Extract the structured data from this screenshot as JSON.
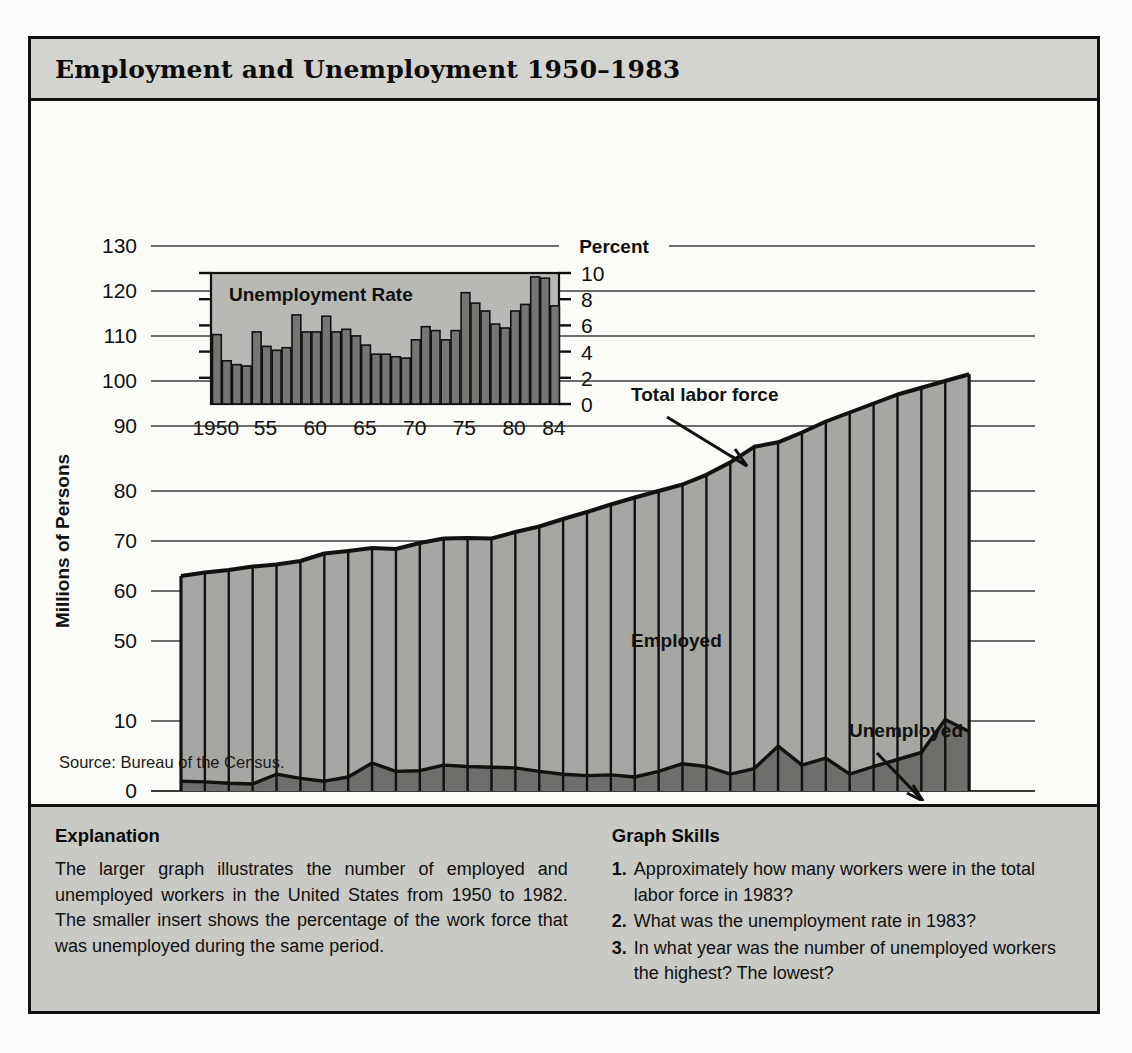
{
  "title": "Employment and Unemployment   1950–1983",
  "source_note": "Source: Bureau of the Census.",
  "explanation": {
    "heading": "Explanation",
    "body": "The larger graph illustrates the number of employed and unemployed workers in the United States from 1950 to 1982. The smaller insert shows the percentage of the work force that was unemployed during the same period."
  },
  "graph_skills": {
    "heading": "Graph Skills",
    "items": [
      {
        "num": "1.",
        "text": "Approximately how many workers were in the total labor force in 1983?"
      },
      {
        "num": "2.",
        "text": "What was the unemployment rate in 1983?"
      },
      {
        "num": "3.",
        "text": "In what year was the number of unemployed workers the highest? The lowest?"
      }
    ]
  },
  "colors": {
    "ink": "#111111",
    "band_title": "#d3d3cf",
    "band_bottom": "#c9c9c5",
    "panel": "#fbfbf8",
    "employed_fill": "#a6a6a2",
    "unemployed_fill": "#6e6e6a",
    "inset_bg": "#b8b8b4",
    "inset_bar": "#757571",
    "gridline": "#3c3c3c"
  },
  "chart_data": {
    "type": "area",
    "title": "Employment and Unemployment 1950–1983",
    "xlabel": "",
    "ylabel": "Millions of Persons",
    "ylim": [
      0,
      130
    ],
    "y_ticks": [
      130,
      120,
      110,
      100,
      90,
      80,
      70,
      60,
      50,
      10,
      0
    ],
    "y_axis_note": "broken axis: labels jump from 50 to 10",
    "grid": true,
    "x": [
      1950,
      1951,
      1952,
      1953,
      1954,
      1955,
      1956,
      1957,
      1958,
      1959,
      1960,
      1961,
      1962,
      1963,
      1964,
      1965,
      1966,
      1967,
      1968,
      1969,
      1970,
      1971,
      1972,
      1973,
      1974,
      1975,
      1976,
      1977,
      1978,
      1979,
      1980,
      1981,
      1982,
      1983
    ],
    "x_tick_labels": [
      "1950",
      "52",
      "54",
      "56",
      "58",
      "60",
      "62",
      "64",
      "66",
      "68",
      "70",
      "72",
      "74",
      "76",
      "78",
      "80",
      "82",
      "84"
    ],
    "x_tick_values": [
      1950,
      1952,
      1954,
      1956,
      1958,
      1960,
      1962,
      1964,
      1966,
      1968,
      1970,
      1972,
      1974,
      1976,
      1978,
      1980,
      1982,
      1984
    ],
    "series": [
      {
        "name": "Total labor force",
        "values": [
          63.0,
          63.7,
          64.2,
          64.9,
          65.3,
          66.0,
          67.5,
          68.0,
          68.6,
          68.4,
          69.6,
          70.5,
          70.6,
          70.5,
          71.8,
          72.9,
          74.4,
          75.8,
          77.3,
          78.7,
          80.0,
          81.0,
          82.5,
          84.4,
          86.8,
          87.5,
          89.0,
          91.0,
          93.0,
          95.0,
          97.0,
          98.5,
          100.0,
          101.5
        ]
      },
      {
        "name": "Employed",
        "values": [
          61.6,
          62.4,
          63.1,
          63.9,
          62.9,
          64.2,
          66.1,
          66.0,
          64.6,
          65.6,
          66.7,
          66.8,
          67.1,
          67.1,
          68.5,
          70.1,
          72.0,
          73.6,
          75.0,
          76.7,
          77.2,
          77.1,
          79.0,
          82.0,
          83.6,
          81.1,
          85.3,
          86.3,
          90.6,
          91.5,
          92.5,
          93.0,
          89.2,
          93.0
        ]
      },
      {
        "name": "Unemployed",
        "values": [
          1.4,
          1.3,
          1.1,
          1.0,
          2.4,
          1.8,
          1.4,
          2.0,
          4.0,
          2.8,
          2.9,
          3.7,
          3.5,
          3.4,
          3.3,
          2.8,
          2.4,
          2.2,
          2.3,
          2.0,
          2.8,
          3.9,
          3.5,
          2.4,
          3.2,
          6.4,
          3.7,
          4.7,
          2.4,
          3.5,
          4.5,
          5.5,
          10.8,
          8.5
        ]
      }
    ],
    "annotations": [
      {
        "label": "Total labor force",
        "x": 1972
      },
      {
        "label": "Employed",
        "x": 1966
      },
      {
        "label": "Unemployed",
        "x": 1977
      }
    ],
    "inset": {
      "type": "bar",
      "title": "Unemployment Rate",
      "ylabel": "Percent",
      "ylim": [
        0,
        10
      ],
      "y_ticks": [
        10,
        8,
        6,
        4,
        2,
        0
      ],
      "x_tick_labels": [
        "1950",
        "55",
        "60",
        "65",
        "70",
        "75",
        "80",
        "84"
      ],
      "x_tick_values": [
        1950,
        1955,
        1960,
        1965,
        1970,
        1975,
        1980,
        1984
      ],
      "categories": [
        1950,
        1951,
        1952,
        1953,
        1954,
        1955,
        1956,
        1957,
        1958,
        1959,
        1960,
        1961,
        1962,
        1963,
        1964,
        1965,
        1966,
        1967,
        1968,
        1969,
        1970,
        1971,
        1972,
        1973,
        1974,
        1975,
        1976,
        1977,
        1978,
        1979,
        1980,
        1981,
        1982,
        1983,
        1984
      ],
      "values": [
        5.3,
        3.3,
        3.0,
        2.9,
        5.5,
        4.4,
        4.1,
        4.3,
        6.8,
        5.5,
        5.5,
        6.7,
        5.5,
        5.7,
        5.2,
        4.5,
        3.8,
        3.8,
        3.6,
        3.5,
        4.9,
        5.9,
        5.6,
        4.9,
        5.6,
        8.5,
        7.7,
        7.1,
        6.1,
        5.8,
        7.1,
        7.6,
        9.7,
        9.6,
        7.5
      ]
    }
  }
}
